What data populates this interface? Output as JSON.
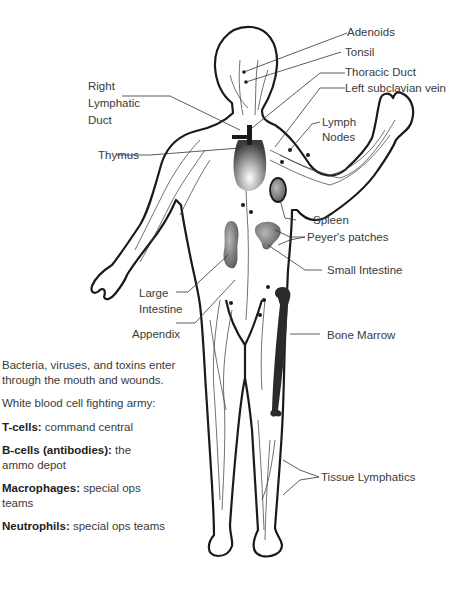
{
  "diagram": {
    "labels": {
      "adenoids": "Adenoids",
      "tonsil": "Tonsil",
      "thoracic_duct": "Thoracic Duct",
      "left_subclavian_vein": "Left subclavian vein",
      "right_lymphatic_duct_1": "Right",
      "right_lymphatic_duct_2": "Lymphatic",
      "right_lymphatic_duct_3": "Duct",
      "thymus": "Thymus",
      "lymph_nodes_1": "Lymph",
      "lymph_nodes_2": "Nodes",
      "spleen": "Spleen",
      "peyers_patches": "Peyer's patches",
      "small_intestine": "Small Intestine",
      "large_intestine_1": "Large",
      "large_intestine_2": "Intestine",
      "appendix": "Appendix",
      "bone_marrow": "Bone Marrow",
      "tissue_lymphatics": "Tissue Lymphatics"
    },
    "colors": {
      "outline": "#1a1a1a",
      "organ_dark": "#555555",
      "organ_light": "#bdbdbd",
      "bone_marrow": "#2a2a2a"
    }
  },
  "legend": {
    "intro": "Bacteria, viruses, and toxins enter through the mouth and wounds.",
    "army_heading": "White blood cell fighting army:",
    "items": [
      {
        "term": "T-cells:",
        "desc": "command central"
      },
      {
        "term": "B-cells (antibodies):",
        "desc": "the ammo depot"
      },
      {
        "term": "Macrophages:",
        "desc": "special ops teams"
      },
      {
        "term": "Neutrophils:",
        "desc": "special ops teams"
      }
    ]
  }
}
